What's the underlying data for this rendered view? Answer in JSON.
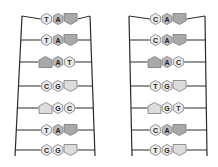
{
  "diagram": {
    "colors": {
      "frame": "#2a2a2a",
      "hex_light": "#ececec",
      "hex_A": "#b9b9b9",
      "pentagon_dark": "#a9a9a9",
      "pentagon_light": "#dcdcdc",
      "outline": "#7a7a7a"
    },
    "ladders": [
      {
        "name": "left",
        "rows": [
          {
            "orient": "right",
            "b1": "T",
            "b2": "A",
            "tail": "dark"
          },
          {
            "orient": "right",
            "b1": "T",
            "b2": "A",
            "tail": "dark"
          },
          {
            "orient": "left",
            "b1": "A",
            "b2": "T",
            "tail": "dark"
          },
          {
            "orient": "right",
            "b1": "C",
            "b2": "G",
            "tail": "light"
          },
          {
            "orient": "left",
            "b1": "G",
            "b2": "C",
            "tail": "light"
          },
          {
            "orient": "right",
            "b1": "T",
            "b2": "A",
            "tail": "dark"
          },
          {
            "orient": "right",
            "b1": "C",
            "b2": "G",
            "tail": "light"
          }
        ]
      },
      {
        "name": "right",
        "rows": [
          {
            "orient": "right",
            "b1": "C",
            "b2": "A",
            "tail": "dark"
          },
          {
            "orient": "right",
            "b1": "C",
            "b2": "A",
            "tail": "dark"
          },
          {
            "orient": "left",
            "b1": "A",
            "b2": "C",
            "tail": "dark"
          },
          {
            "orient": "right",
            "b1": "T",
            "b2": "G",
            "tail": "light"
          },
          {
            "orient": "left",
            "b1": "G",
            "b2": "T",
            "tail": "light"
          },
          {
            "orient": "right",
            "b1": "C",
            "b2": "A",
            "tail": "dark"
          },
          {
            "orient": "right",
            "b1": "T",
            "b2": "G",
            "tail": "light"
          }
        ]
      }
    ]
  }
}
